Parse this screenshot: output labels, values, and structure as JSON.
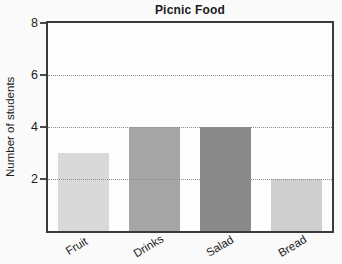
{
  "title": "Picnic Food",
  "chart_data": {
    "type": "bar",
    "title": "Picnic Food",
    "categories": [
      "Fruit",
      "Drinks",
      "Salad",
      "Bread"
    ],
    "values": [
      3,
      4,
      4,
      2
    ],
    "bar_colors": [
      "#d9d9d9",
      "#a6a6a6",
      "#8a8a8a",
      "#cfcfcf"
    ],
    "xlabel": "",
    "ylabel": "Number of students",
    "ylim": [
      0,
      8
    ],
    "yticks": [
      2,
      4,
      6,
      8
    ],
    "grid": "horizontal dotted lines at 2, 4, 6",
    "legend_position": "none",
    "frame_color": "#3a3a3a",
    "page_bg": "#fafafa",
    "plot_bg": "#fdfdfd",
    "text_color": "#1c1c1c"
  }
}
